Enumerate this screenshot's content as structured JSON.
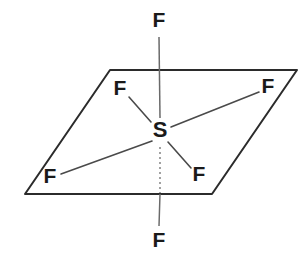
{
  "diagram": {
    "background_color": "#ffffff",
    "plane_color": "#2b2b2b",
    "bond_color": "#4a4a4a",
    "label_color": "#1a1a1a",
    "center_atom": {
      "name": "center-atom-sulfur",
      "symbol": "S",
      "x": 160,
      "y": 131
    },
    "equatorial_plane": {
      "name": "equatorial-plane",
      "points": "110,70 297,70 212,194 25,194"
    },
    "atoms": [
      {
        "id": "fluorine-axial-top",
        "symbol": "F",
        "position": "axial-top",
        "x": 159,
        "y": 21
      },
      {
        "id": "fluorine-equatorial-upper-left",
        "symbol": "F",
        "position": "equatorial-upper-left",
        "x": 120,
        "y": 89
      },
      {
        "id": "fluorine-equatorial-upper-right",
        "symbol": "F",
        "position": "equatorial-upper-right",
        "x": 268,
        "y": 87
      },
      {
        "id": "fluorine-equatorial-lower-left",
        "symbol": "F",
        "position": "equatorial-lower-left",
        "x": 50,
        "y": 177
      },
      {
        "id": "fluorine-equatorial-lower-right",
        "symbol": "F",
        "position": "equatorial-lower-right",
        "x": 199,
        "y": 175
      },
      {
        "id": "fluorine-axial-bottom",
        "symbol": "F",
        "position": "axial-bottom",
        "x": 159,
        "y": 241
      }
    ],
    "bonds": [
      {
        "id": "bond-axial-top",
        "style": "solid",
        "from": "center-atom-sulfur",
        "to": "fluorine-axial-top",
        "x1": 160,
        "y1": 118,
        "x2": 159,
        "y2": 37
      },
      {
        "id": "bond-upper-left",
        "style": "solid",
        "from": "center-atom-sulfur",
        "to": "fluorine-equatorial-upper-left",
        "x1": 151,
        "y1": 122,
        "x2": 129,
        "y2": 97
      },
      {
        "id": "bond-upper-right",
        "style": "solid",
        "from": "center-atom-sulfur",
        "to": "fluorine-equatorial-upper-right",
        "x1": 171,
        "y1": 127,
        "x2": 259,
        "y2": 92
      },
      {
        "id": "bond-lower-left",
        "style": "solid",
        "from": "center-atom-sulfur",
        "to": "fluorine-equatorial-lower-left",
        "x1": 152,
        "y1": 141,
        "x2": 61,
        "y2": 174
      },
      {
        "id": "bond-lower-right",
        "style": "solid",
        "from": "center-atom-sulfur",
        "to": "fluorine-equatorial-lower-right",
        "x1": 168,
        "y1": 142,
        "x2": 191,
        "y2": 168
      },
      {
        "id": "bond-axial-bottom-hidden",
        "style": "dotted",
        "from": "center-atom-sulfur",
        "to": "plane-intersection",
        "x1": 160,
        "y1": 145,
        "x2": 160,
        "y2": 194
      },
      {
        "id": "bond-axial-bottom",
        "style": "solid",
        "from": "plane-intersection",
        "to": "fluorine-axial-bottom",
        "x1": 160,
        "y1": 194,
        "x2": 159,
        "y2": 226
      }
    ]
  }
}
